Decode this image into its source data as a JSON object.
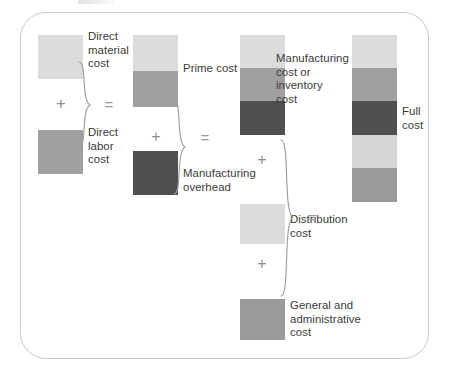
{
  "diagram": {
    "frame_border_color": "#c9c9c9",
    "background": "#ffffff",
    "text_color": "#3a3a3a",
    "operator_color": "#8d8d8d",
    "palette": {
      "light": "#dcdcdc",
      "medium": "#a0a0a0",
      "dark": "#4f4f4f",
      "light_alt": "#d6d6d6",
      "medium_alt": "#9a9a9a"
    },
    "operators": {
      "plus": "+",
      "equals": "="
    },
    "columns": [
      {
        "id": "inputs",
        "name": "direct-costs-column",
        "blocks": [
          {
            "id": "direct-material",
            "label": "Direct\nmaterial\ncost",
            "color_key": "light",
            "color": "#dcdcdc"
          },
          {
            "id": "direct-labor",
            "label": "Direct\nlabor\ncost",
            "color_key": "medium",
            "color": "#a0a0a0"
          }
        ]
      },
      {
        "id": "prime",
        "name": "prime-cost-column",
        "stack_label": "Prime cost",
        "blocks": [
          {
            "id": "prime-material",
            "label": "",
            "color_key": "light",
            "color": "#dcdcdc"
          },
          {
            "id": "prime-labor",
            "label": "",
            "color_key": "medium",
            "color": "#a0a0a0"
          }
        ],
        "extra_blocks": [
          {
            "id": "manufacturing-overhead",
            "label": "Manufacturing\noverhead",
            "color_key": "dark",
            "color": "#4f4f4f"
          }
        ]
      },
      {
        "id": "manufacturing",
        "name": "manufacturing-cost-column",
        "stack_label": "Manufacturing\ncost or\ninventory\ncost",
        "blocks": [
          {
            "id": "mfg-material",
            "label": "",
            "color_key": "light",
            "color": "#dcdcdc"
          },
          {
            "id": "mfg-labor",
            "label": "",
            "color_key": "medium",
            "color": "#a0a0a0"
          },
          {
            "id": "mfg-overhead",
            "label": "",
            "color_key": "dark",
            "color": "#4f4f4f"
          }
        ],
        "extra_blocks": [
          {
            "id": "distribution",
            "label": "Distribution\ncost",
            "color_key": "light",
            "color": "#dcdcdc"
          },
          {
            "id": "general-admin",
            "label": "General and\nadministrative\ncost",
            "color_key": "medium",
            "color": "#9a9a9a"
          }
        ]
      },
      {
        "id": "full",
        "name": "full-cost-column",
        "stack_label": "Full\ncost",
        "blocks": [
          {
            "id": "full-material",
            "label": "",
            "color_key": "light",
            "color": "#dcdcdc"
          },
          {
            "id": "full-labor",
            "label": "",
            "color_key": "medium",
            "color": "#a0a0a0"
          },
          {
            "id": "full-overhead",
            "label": "",
            "color_key": "dark",
            "color": "#4f4f4f"
          },
          {
            "id": "full-distribution",
            "label": "",
            "color_key": "light_alt",
            "color": "#d6d6d6"
          },
          {
            "id": "full-admin",
            "label": "",
            "color_key": "medium_alt",
            "color": "#9a9a9a"
          }
        ]
      }
    ],
    "labels": {
      "direct_material": "Direct\nmaterial\ncost",
      "direct_labor": "Direct\nlabor\ncost",
      "prime_cost": "Prime cost",
      "manufacturing_overhead": "Manufacturing\noverhead",
      "manufacturing_cost": "Manufacturing\ncost or\ninventory\ncost",
      "distribution_cost": "Distribution\ncost",
      "general_admin_cost": "General and\nadministrative\ncost",
      "full_cost": "Full\ncost"
    },
    "equations": [
      {
        "id": "eq-prime",
        "plus": "+",
        "equals": "=",
        "result": "Prime cost"
      },
      {
        "id": "eq-manufacturing",
        "plus": "+",
        "equals": "=",
        "result": "Manufacturing cost or inventory cost"
      },
      {
        "id": "eq-full",
        "plus": "+",
        "equals": "=",
        "result": "Full cost"
      }
    ]
  }
}
